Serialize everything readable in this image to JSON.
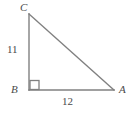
{
  "figure": {
    "type": "right-triangle-diagram",
    "background_color": "#ffffff",
    "stroke_color": "#808080",
    "label_color": "#4a4a4a",
    "vertices": {
      "a": {
        "label": "A",
        "x": 114,
        "y": 90
      },
      "b": {
        "label": "B",
        "x": 29,
        "y": 90
      },
      "c": {
        "label": "C",
        "x": 29,
        "y": 14
      }
    },
    "sides": {
      "vertical_leg": {
        "label": "11",
        "from": "B",
        "to": "C"
      },
      "horizontal_leg": {
        "label": "12",
        "from": "B",
        "to": "A"
      },
      "hypotenuse": {
        "label": "",
        "from": "C",
        "to": "A"
      }
    },
    "right_angle": {
      "at_vertex": "B",
      "marker": "right-angle-square",
      "size": 9
    }
  }
}
